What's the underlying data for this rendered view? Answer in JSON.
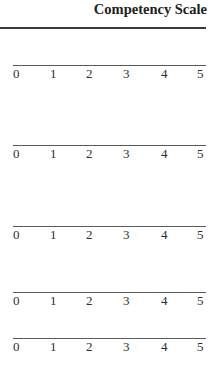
{
  "header": {
    "title": "Competency Scale"
  },
  "scales": [
    {
      "ticks": [
        "0",
        "1",
        "2",
        "3",
        "4",
        "5"
      ]
    },
    {
      "ticks": [
        "0",
        "1",
        "2",
        "3",
        "4",
        "5"
      ]
    },
    {
      "ticks": [
        "0",
        "1",
        "2",
        "3",
        "4",
        "5"
      ]
    },
    {
      "ticks": [
        "0",
        "1",
        "2",
        "3",
        "4",
        "5"
      ]
    },
    {
      "ticks": [
        "0",
        "1",
        "2",
        "3",
        "4",
        "5"
      ]
    }
  ]
}
